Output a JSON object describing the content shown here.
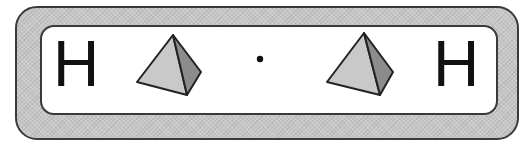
{
  "diagram": {
    "title": "",
    "left_atom": {
      "label": "H"
    },
    "right_atom": {
      "label": "H"
    },
    "center_symbol": {
      "label": "·",
      "description": "electron dot"
    },
    "left_shape": {
      "type": "tetrahedron",
      "icon": "pyramid-icon"
    },
    "right_shape": {
      "type": "tetrahedron",
      "icon": "pyramid-icon"
    },
    "colors": {
      "outer_band": "#c6c6c6",
      "inner_panel": "#ffffff",
      "border": "#3a3a3a",
      "face_light": "#c9c9c9",
      "face_dark": "#8c8c8c",
      "text": "#111111"
    }
  }
}
